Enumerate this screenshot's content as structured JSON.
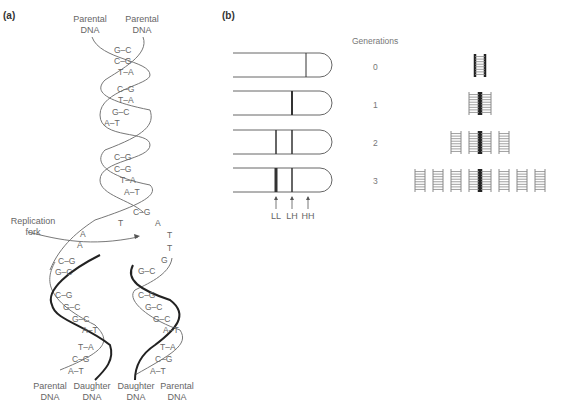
{
  "panel_a": {
    "label": "(a)",
    "top_labels": [
      "Parental\nDNA",
      "Parental\nDNA"
    ],
    "bottom_labels": [
      "Parental\nDNA",
      "Daughter\nDNA",
      "Daughter\nDNA",
      "Parental\nDNA"
    ],
    "fork_label": "Replication\nfork",
    "base_pairs_top": [
      "G-C",
      "C-G",
      "T-A",
      "C-G",
      "T-A",
      "G-C",
      "A-T",
      "C-G",
      "C-G",
      "T-A",
      "A-T",
      "C-G"
    ],
    "unpaired_left": [
      "T",
      "A",
      "A"
    ],
    "unpaired_right": [
      "A",
      "T",
      "T",
      "G"
    ],
    "left_daughter_pairs": [
      "C-G",
      "G-C",
      "C-G",
      "G-C",
      "G-C",
      "A-T",
      "T-A",
      "C-G",
      "A-T"
    ],
    "right_daughter_pairs": [
      "G-C",
      "C-G",
      "G-C",
      "G-C",
      "A-T",
      "T-A",
      "C-G",
      "A-T"
    ]
  },
  "panel_b": {
    "label": "(b)",
    "generations_title": "Generations",
    "generations": [
      "0",
      "1",
      "2",
      "3"
    ],
    "band_labels": [
      "LL",
      "LH",
      "HH"
    ],
    "ladder_counts": [
      1,
      2,
      4,
      8
    ]
  }
}
